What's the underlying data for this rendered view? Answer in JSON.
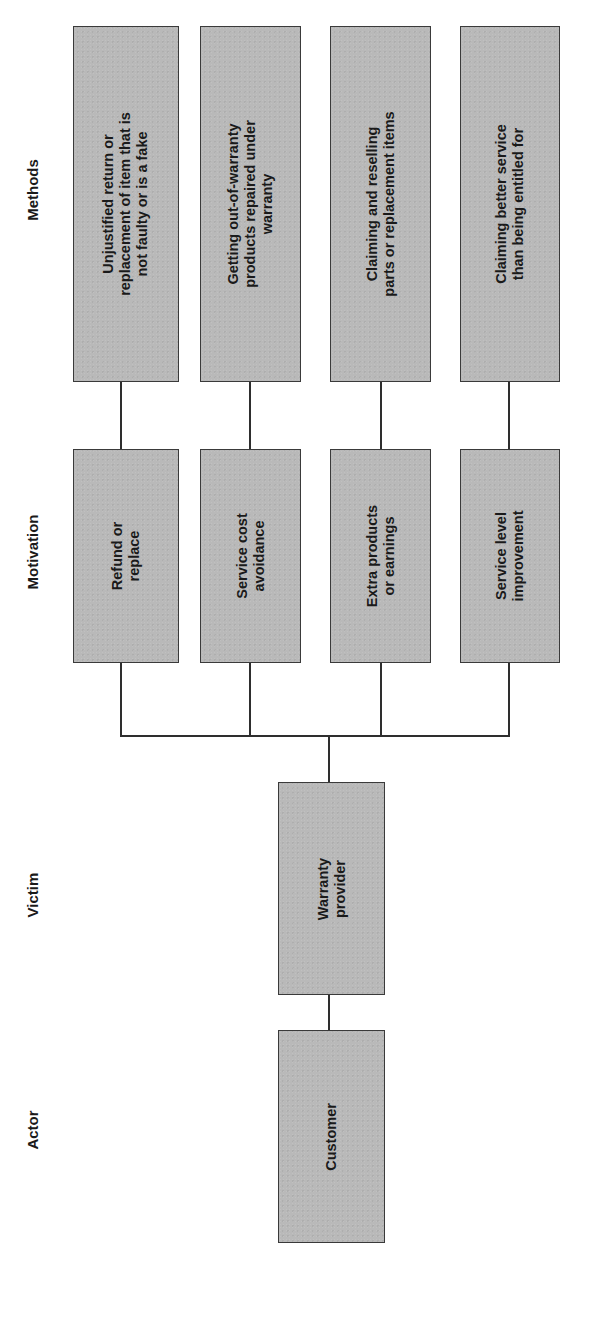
{
  "columns": {
    "methods": "Methods",
    "motivation": "Motivation",
    "victim": "Victim",
    "actor": "Actor"
  },
  "methods": [
    {
      "label": "Unjustified return or\nreplacement of item that is\nnot faulty or is a fake"
    },
    {
      "label": "Getting out-of-warranty\nproducts repaired under\nwarranty"
    },
    {
      "label": "Claiming and reselling\nparts or replacement items"
    },
    {
      "label": "Claiming better service\nthan being entitled for"
    }
  ],
  "motivations": [
    {
      "label": "Refund or\nreplace"
    },
    {
      "label": "Service cost\navoidance"
    },
    {
      "label": "Extra products\nor earnings"
    },
    {
      "label": "Service level\nimprovement"
    }
  ],
  "victim": {
    "label": "Warranty\nprovider"
  },
  "actor": {
    "label": "Customer"
  },
  "colors": {
    "box_fill": "#b9b9b9",
    "box_border": "#3a3a3a",
    "line": "#2e2e2e",
    "text": "#1a1a1a",
    "background": "#ffffff"
  }
}
